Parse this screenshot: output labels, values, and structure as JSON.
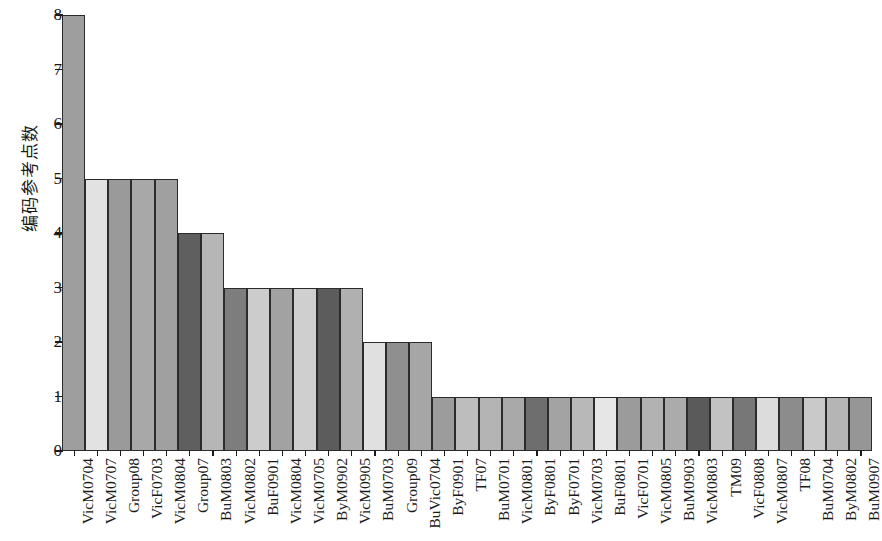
{
  "chart_data": {
    "type": "bar",
    "title": "",
    "subtitle": "",
    "xlabel": "",
    "ylabel": "编码参考点数",
    "ylim": [
      0,
      8
    ],
    "yticks": [
      0,
      1,
      2,
      3,
      4,
      5,
      6,
      7,
      8
    ],
    "grid": false,
    "legend": null,
    "orientation": "vertical",
    "categories": [
      "VicM0704",
      "VicM0707",
      "Group08",
      "VicF0703",
      "VicM0804",
      "Group07",
      "BuM0803",
      "VicM0802",
      "BuF0901",
      "VicM0804",
      "VicM0705",
      "ByM0902",
      "VicM0905",
      "BuM0703",
      "Group09",
      "BuVic0704",
      "ByF0901",
      "TF07",
      "BuM0701",
      "VicM0801",
      "ByF0801",
      "ByF0701",
      "VicM0703",
      "BuF0801",
      "VicF0701",
      "VicM0805",
      "BuM0903",
      "VicM0803",
      "TM09",
      "VicF0808",
      "VicM0807",
      "TF08",
      "BuM0704",
      "ByM0802",
      "BuM0907"
    ],
    "values": [
      8,
      5,
      5,
      5,
      5,
      4,
      4,
      3,
      3,
      3,
      3,
      3,
      3,
      2,
      2,
      2,
      1,
      1,
      1,
      1,
      1,
      1,
      1,
      1,
      1,
      1,
      1,
      1,
      1,
      1,
      1,
      1,
      1,
      1,
      1
    ],
    "bar_fills": [
      "#9e9e9e",
      "#e2e2e2",
      "#9a9a9a",
      "#a8a8a8",
      "#a0a0a0",
      "#5f5f5f",
      "#b6b6b6",
      "#7d7d7d",
      "#cccccc",
      "#a2a2a2",
      "#cfcfcf",
      "#5c5c5c",
      "#b0b0b0",
      "#e0e0e0",
      "#8f8f8f",
      "#a6a6a6",
      "#9c9c9c",
      "#bdbdbd",
      "#b4b4b4",
      "#a9a9a9",
      "#6e6e6e",
      "#a3a3a3",
      "#b8b8b8",
      "#e6e6e6",
      "#9b9b9b",
      "#b2b2b2",
      "#ababab",
      "#5a5a5a",
      "#c2c2c2",
      "#777777",
      "#dcdcdc",
      "#8c8c8c",
      "#c9c9c9",
      "#b5b5b5",
      "#969696"
    ],
    "axis_color": "#1a1a1a",
    "bar_edge_color": "#2b2b2b",
    "background": "#ffffff"
  }
}
